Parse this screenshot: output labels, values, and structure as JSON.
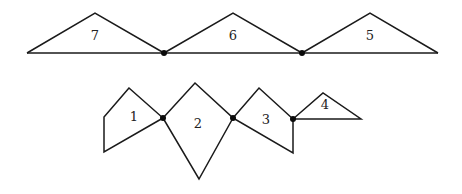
{
  "diagram": {
    "top_row": {
      "shapes": [
        {
          "id": "shape-7",
          "label": "7",
          "kind": "triangle"
        },
        {
          "id": "shape-6",
          "label": "6",
          "kind": "triangle"
        },
        {
          "id": "shape-5",
          "label": "5",
          "kind": "triangle"
        }
      ],
      "joint_count": 2
    },
    "bottom_row": {
      "shapes": [
        {
          "id": "shape-1",
          "label": "1",
          "kind": "quadrilateral"
        },
        {
          "id": "shape-2",
          "label": "2",
          "kind": "kite"
        },
        {
          "id": "shape-3",
          "label": "3",
          "kind": "quadrilateral"
        },
        {
          "id": "shape-4",
          "label": "4",
          "kind": "triangle"
        }
      ],
      "joint_count": 3
    }
  }
}
